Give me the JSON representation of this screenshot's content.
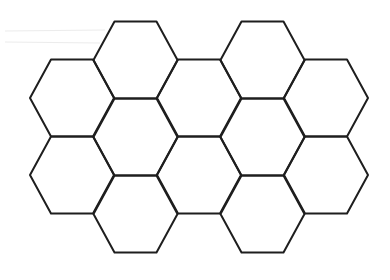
{
  "diagram": {
    "title": "",
    "type": "hexagonal-grid",
    "orientation": "flat-top",
    "stroke_color": "#1e1e1e",
    "background_color": "#ffffff",
    "hex_count": 12,
    "hex_size": {
      "half_width": 42,
      "top_half_width": 21,
      "half_height": 38.5
    },
    "columns": [
      {
        "cx": 72,
        "rows": [
          98,
          175
        ]
      },
      {
        "cx": 135.5,
        "rows": [
          60,
          137,
          214
        ]
      },
      {
        "cx": 199,
        "rows": [
          98,
          175
        ]
      },
      {
        "cx": 262.5,
        "rows": [
          60,
          137,
          214
        ]
      },
      {
        "cx": 326,
        "rows": [
          98,
          175
        ]
      }
    ]
  }
}
